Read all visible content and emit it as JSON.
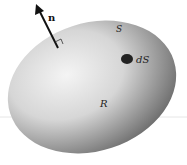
{
  "diagram": {
    "labels": {
      "normal": "n",
      "surface": "S",
      "surface_element": "dS",
      "region": "R"
    },
    "colors": {
      "background": "#ffffff",
      "body_light": "#f2f2f2",
      "body_dark": "#6a6a6a",
      "element": "#222222",
      "arrow": "#111111"
    }
  }
}
